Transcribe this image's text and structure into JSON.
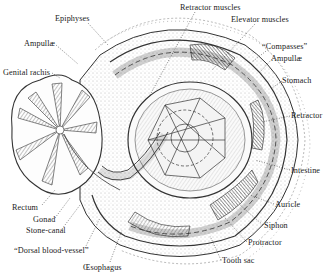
{
  "figure": {
    "colors": {
      "ink": "#2a2a2a",
      "background": "#ffffff",
      "shade": "#555555"
    }
  },
  "labels": [
    {
      "id": "retractor-muscles",
      "text": "Retractor muscles",
      "x": 180,
      "y": 4
    },
    {
      "id": "epiphyses",
      "text": "Epiphyses",
      "x": 55,
      "y": 15
    },
    {
      "id": "elevator-muscles",
      "text": "Elevator muscles",
      "x": 231,
      "y": 16
    },
    {
      "id": "compasses",
      "text": "“Compasses”",
      "x": 262,
      "y": 43
    },
    {
      "id": "ampullae-right",
      "text": "Ampullæ",
      "x": 271,
      "y": 55
    },
    {
      "id": "ampullae-left",
      "text": "Ampullæ",
      "x": 24,
      "y": 40
    },
    {
      "id": "genital-rachis",
      "text": "Genital rachis",
      "x": 3,
      "y": 69
    },
    {
      "id": "stomach",
      "text": "Stomach",
      "x": 282,
      "y": 77
    },
    {
      "id": "retractor",
      "text": "Retractor",
      "x": 291,
      "y": 112
    },
    {
      "id": "intestine",
      "text": "Intestine",
      "x": 291,
      "y": 167
    },
    {
      "id": "auricle",
      "text": "Auricle",
      "x": 275,
      "y": 201
    },
    {
      "id": "siphon",
      "text": "Siphon",
      "x": 264,
      "y": 222
    },
    {
      "id": "protractor",
      "text": "Protractor",
      "x": 248,
      "y": 239
    },
    {
      "id": "tooth-sac",
      "text": "Tooth sac",
      "x": 222,
      "y": 257
    },
    {
      "id": "rectum",
      "text": "Rectum",
      "x": 12,
      "y": 204
    },
    {
      "id": "gonad",
      "text": "Gonad",
      "x": 33,
      "y": 216
    },
    {
      "id": "stone-canal",
      "text": "Stone-canal",
      "x": 26,
      "y": 227
    },
    {
      "id": "dorsal-blood-vessel",
      "text": "“Dorsal blood-vessel”",
      "x": 14,
      "y": 247
    },
    {
      "id": "oesophagus",
      "text": "Œsophagus",
      "x": 83,
      "y": 264
    }
  ]
}
